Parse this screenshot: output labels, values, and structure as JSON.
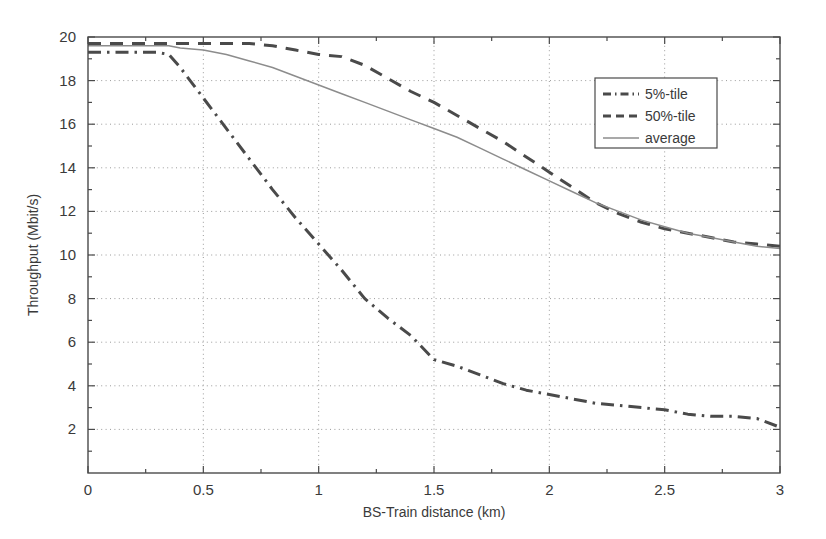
{
  "chart_data": {
    "type": "line",
    "title": "",
    "xlabel": "BS-Train distance (km)",
    "ylabel": "Throughput (Mbit/s)",
    "xlim": [
      0,
      3
    ],
    "ylim": [
      0,
      20
    ],
    "xticks": [
      "0",
      "0.5",
      "1",
      "1.5",
      "2",
      "2.5",
      "3"
    ],
    "xtick_values": [
      0,
      0.5,
      1,
      1.5,
      2,
      2.5,
      3
    ],
    "yticks": [
      "2",
      "4",
      "6",
      "8",
      "10",
      "12",
      "14",
      "16",
      "18",
      "20"
    ],
    "ytick_values": [
      2,
      4,
      6,
      8,
      10,
      12,
      14,
      16,
      18,
      20
    ],
    "grid": true,
    "grid_style": "dotted",
    "legend_position": "upper right",
    "legend_entries": [
      "5%-tile",
      "50%-tile",
      "average"
    ],
    "x": [
      0.0,
      0.1,
      0.2,
      0.3,
      0.35,
      0.4,
      0.5,
      0.6,
      0.7,
      0.8,
      0.9,
      1.0,
      1.1,
      1.2,
      1.3,
      1.4,
      1.5,
      1.6,
      1.7,
      1.8,
      1.9,
      2.0,
      2.1,
      2.2,
      2.3,
      2.4,
      2.5,
      2.6,
      2.7,
      2.8,
      2.9,
      3.0
    ],
    "series": [
      {
        "name": "5%-tile",
        "style": "dash-dot",
        "color": "#4a4a4a",
        "values": [
          19.3,
          19.3,
          19.3,
          19.3,
          19.2,
          18.6,
          17.2,
          15.8,
          14.4,
          13.0,
          11.7,
          10.5,
          9.3,
          8.0,
          7.1,
          6.3,
          5.2,
          4.9,
          4.5,
          4.1,
          3.8,
          3.6,
          3.4,
          3.2,
          3.1,
          3.0,
          2.9,
          2.7,
          2.6,
          2.6,
          2.5,
          2.1
        ]
      },
      {
        "name": "50%-tile",
        "style": "dashed",
        "color": "#4a4a4a",
        "values": [
          19.7,
          19.7,
          19.7,
          19.7,
          19.7,
          19.7,
          19.7,
          19.7,
          19.7,
          19.6,
          19.4,
          19.2,
          19.1,
          18.7,
          18.1,
          17.5,
          17.0,
          16.4,
          15.8,
          15.2,
          14.5,
          13.8,
          13.1,
          12.4,
          11.9,
          11.5,
          11.2,
          11.0,
          10.8,
          10.6,
          10.5,
          10.4
        ]
      },
      {
        "name": "average",
        "style": "solid",
        "color": "#8c8c8c",
        "values": [
          19.6,
          19.6,
          19.6,
          19.6,
          19.6,
          19.5,
          19.4,
          19.2,
          18.9,
          18.6,
          18.2,
          17.8,
          17.4,
          17.0,
          16.6,
          16.2,
          15.8,
          15.4,
          14.9,
          14.4,
          13.9,
          13.4,
          12.9,
          12.4,
          12.0,
          11.6,
          11.3,
          11.0,
          10.8,
          10.6,
          10.4,
          10.3
        ]
      }
    ]
  },
  "figure": {
    "background": "#ffffff",
    "axis_color": "#4a4a4a",
    "grid_color": "#9a9a9a"
  }
}
